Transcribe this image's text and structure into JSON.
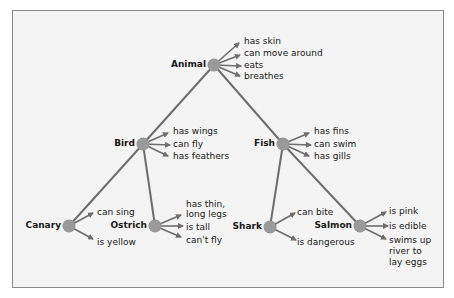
{
  "diagram": {
    "type": "semantic-network-hierarchy",
    "colors": {
      "frame_bg": "#f4f4f4",
      "frame_border": "#8a8a8a",
      "node_fill": "#9a9a9a",
      "line": "#6e6e6e",
      "text": "#1a1a1a"
    },
    "nodes": {
      "animal": {
        "label": "Animal",
        "properties": [
          "has skin",
          "can move around",
          "eats",
          "breathes"
        ]
      },
      "bird": {
        "label": "Bird",
        "properties": [
          "has wings",
          "can fly",
          "has feathers"
        ]
      },
      "fish": {
        "label": "Fish",
        "properties": [
          "has fins",
          "can swim",
          "has gills"
        ]
      },
      "canary": {
        "label": "Canary",
        "properties": [
          "can sing",
          "is yellow"
        ]
      },
      "ostrich": {
        "label": "Ostrich",
        "properties": [
          "has thin,",
          "long legs",
          "is tall",
          "can't fly"
        ]
      },
      "shark": {
        "label": "Shark",
        "properties": [
          "can bite",
          "is dangerous"
        ]
      },
      "salmon": {
        "label": "Salmon",
        "properties": [
          "is pink",
          "is edible",
          "swims up",
          "river to",
          "lay eggs"
        ]
      }
    },
    "edges": [
      [
        "animal",
        "bird"
      ],
      [
        "animal",
        "fish"
      ],
      [
        "bird",
        "canary"
      ],
      [
        "bird",
        "ostrich"
      ],
      [
        "fish",
        "shark"
      ],
      [
        "fish",
        "salmon"
      ]
    ]
  }
}
